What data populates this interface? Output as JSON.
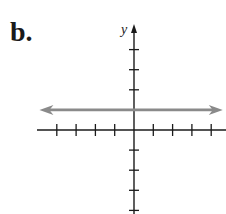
{
  "panel": {
    "label": "b."
  },
  "chart_data": {
    "type": "line",
    "title": "",
    "xlabel": "",
    "ylabel": "y",
    "grid": false,
    "legend": null,
    "xlim": [
      -4,
      4
    ],
    "ylim": [
      -4,
      4
    ],
    "x_ticks": [
      -4,
      -3,
      -2,
      -1,
      1,
      2,
      3,
      4
    ],
    "y_ticks": [
      -4,
      -3,
      -2,
      -1,
      1,
      2,
      3,
      4
    ],
    "tick_labels_shown": false,
    "series": [
      {
        "name": "horizontal line",
        "equation": "y = 1",
        "x": [
          -4.9,
          4.6
        ],
        "y": [
          1,
          1
        ],
        "color": "#8a8a8a",
        "arrows": "both"
      }
    ]
  },
  "colors": {
    "axis": "#1a1a1a",
    "line": "#8a8a8a"
  }
}
